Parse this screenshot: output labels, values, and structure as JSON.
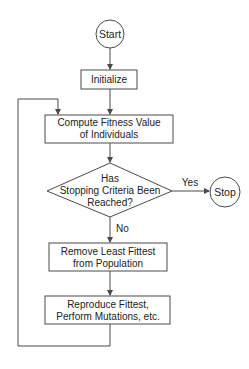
{
  "diagram": {
    "type": "flowchart",
    "colors": {
      "stroke": "#4a4a4a",
      "text": "#222222",
      "background": "#ffffff"
    },
    "nodes": {
      "start": {
        "shape": "circle",
        "label": "Start"
      },
      "initialize": {
        "shape": "rect",
        "label": "Initialize"
      },
      "compute": {
        "shape": "rect",
        "lines": [
          "Compute Fitness Value",
          "of Individuals"
        ]
      },
      "decision": {
        "shape": "diamond",
        "lines": [
          "Has",
          "Stopping Criteria Been",
          "Reached?"
        ]
      },
      "stop": {
        "shape": "circle",
        "label": "Stop"
      },
      "remove": {
        "shape": "rect",
        "lines": [
          "Remove Least Fittest",
          "from Population"
        ]
      },
      "reproduce": {
        "shape": "rect",
        "lines": [
          "Reproduce Fittest,",
          "Perform Mutations, etc."
        ]
      }
    },
    "edges": {
      "yes_label": "Yes",
      "no_label": "No"
    }
  }
}
